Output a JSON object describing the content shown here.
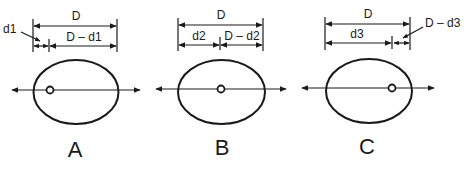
{
  "diagram": {
    "colors": {
      "stroke": "#1a1a1a",
      "background": "#ffffff"
    },
    "panels": [
      {
        "id": "A",
        "label": "A",
        "total_label": "D",
        "part1_label": "d1",
        "part2_label": "D – d1",
        "point_position": "near left edge"
      },
      {
        "id": "B",
        "label": "B",
        "total_label": "D",
        "part1_label": "d2",
        "part2_label": "D – d2",
        "point_position": "center"
      },
      {
        "id": "C",
        "label": "C",
        "total_label": "D",
        "part1_label": "d3",
        "part2_label": "D – d3",
        "point_position": "near right edge"
      }
    ]
  }
}
